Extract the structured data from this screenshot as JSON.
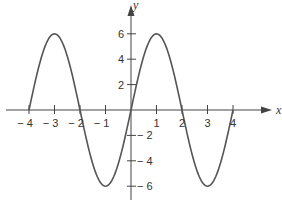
{
  "chart_data": {
    "type": "line",
    "title": "",
    "xlabel": "x",
    "ylabel": "y",
    "function": "y = 6 sin(pi x / 2)",
    "xlim": [
      -4,
      4
    ],
    "ylim": [
      -6,
      6
    ],
    "grid": false,
    "legend": null,
    "x_ticks": [
      -4,
      -3,
      -2,
      -1,
      1,
      2,
      3,
      4
    ],
    "x_tick_labels": [
      "− 4",
      "− 3",
      "− 2",
      "− 1",
      "1",
      "2",
      "3",
      "4"
    ],
    "y_ticks": [
      6,
      4,
      2,
      -2,
      -4,
      -6
    ],
    "y_tick_labels": [
      "6",
      "4",
      "2",
      "− 2",
      "− 4",
      "− 6"
    ],
    "series": [
      {
        "name": "curve",
        "x": [
          -4,
          -3.5,
          -3,
          -2.5,
          -2,
          -1.5,
          -1,
          -0.5,
          0,
          0.5,
          1,
          1.5,
          2,
          2.5,
          3,
          3.5,
          4
        ],
        "values": [
          0,
          4.24,
          6,
          4.24,
          0,
          -4.24,
          -6,
          -4.24,
          0,
          4.24,
          6,
          4.24,
          0,
          -4.24,
          -6,
          -4.24,
          0
        ]
      }
    ],
    "key_points": {
      "maxima": [
        [
          -3,
          6
        ],
        [
          1,
          6
        ]
      ],
      "minima": [
        [
          -1,
          -6
        ],
        [
          3,
          -6
        ]
      ],
      "zeros": [
        -4,
        -2,
        0,
        2,
        4
      ]
    }
  },
  "colors": {
    "curve": "#555555",
    "axes": "#444444",
    "text": "#333333"
  }
}
